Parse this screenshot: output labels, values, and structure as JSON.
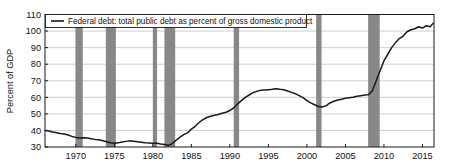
{
  "chart_data": {
    "type": "line",
    "title": "",
    "subtitle": "",
    "xlabel": "",
    "ylabel": "Percent of GDP",
    "legend": [
      {
        "name": "Federal debt: total public debt as percent of gross domestic product",
        "color": "#1a1a1a",
        "position": "top-left-inside"
      }
    ],
    "xlim": [
      1966.0,
      2016.5
    ],
    "ylim": [
      30,
      110
    ],
    "xticks": [
      1970,
      1975,
      1980,
      1985,
      1990,
      1995,
      2000,
      2005,
      2010,
      2015
    ],
    "xtick_labels": [
      "1970",
      "1975",
      "1980",
      "1985",
      "1990",
      "1995",
      "2000",
      "2005",
      "2010",
      "2015"
    ],
    "yticks": [
      30,
      40,
      50,
      60,
      70,
      80,
      90,
      100,
      110
    ],
    "ytick_labels": [
      "30",
      "40",
      "50",
      "60",
      "70",
      "80",
      "90",
      "100",
      "110"
    ],
    "grid": {
      "horizontal": true,
      "vertical": false,
      "color": "#c9c9c9"
    },
    "shaded_bands": {
      "name": "recession-bands",
      "color": "#888888",
      "orientation": "vertical",
      "intervals": [
        [
          1969.95,
          1970.9
        ],
        [
          1973.9,
          1975.2
        ],
        [
          1980.0,
          1980.55
        ],
        [
          1981.5,
          1982.9
        ],
        [
          1990.5,
          1991.2
        ],
        [
          2001.2,
          2001.9
        ],
        [
          2007.95,
          2009.45
        ]
      ]
    },
    "series": [
      {
        "name": "Federal debt: total public debt as percent of gross domestic product",
        "color": "#1a1a1a",
        "x": [
          1966.0,
          1966.5,
          1967.0,
          1967.5,
          1968.0,
          1968.5,
          1969.0,
          1969.5,
          1970.0,
          1970.5,
          1971.0,
          1971.5,
          1972.0,
          1972.5,
          1973.0,
          1973.5,
          1974.0,
          1974.5,
          1975.0,
          1975.5,
          1976.0,
          1976.5,
          1977.0,
          1977.5,
          1978.0,
          1978.5,
          1979.0,
          1979.5,
          1980.0,
          1980.5,
          1981.0,
          1981.5,
          1982.0,
          1982.5,
          1983.0,
          1983.5,
          1984.0,
          1984.5,
          1985.0,
          1985.5,
          1986.0,
          1986.5,
          1987.0,
          1987.5,
          1988.0,
          1988.5,
          1989.0,
          1989.5,
          1990.0,
          1990.5,
          1991.0,
          1991.5,
          1992.0,
          1992.5,
          1993.0,
          1993.5,
          1994.0,
          1994.5,
          1995.0,
          1995.5,
          1996.0,
          1996.5,
          1997.0,
          1997.5,
          1998.0,
          1998.5,
          1999.0,
          1999.5,
          2000.0,
          2000.5,
          2001.0,
          2001.5,
          2002.0,
          2002.5,
          2003.0,
          2003.5,
          2004.0,
          2004.5,
          2005.0,
          2005.5,
          2006.0,
          2006.5,
          2007.0,
          2007.5,
          2008.0,
          2008.5,
          2009.0,
          2009.5,
          2010.0,
          2010.5,
          2011.0,
          2011.5,
          2012.0,
          2012.5,
          2013.0,
          2013.5,
          2014.0,
          2014.5,
          2015.0,
          2015.5,
          2016.0,
          2016.4
        ],
        "y": [
          40.0,
          39.6,
          39.0,
          38.6,
          38.2,
          37.9,
          37.2,
          36.4,
          35.8,
          35.5,
          35.6,
          35.4,
          35.0,
          34.6,
          34.4,
          33.8,
          33.2,
          32.6,
          32.2,
          32.5,
          33.0,
          33.4,
          33.7,
          33.5,
          33.2,
          32.9,
          32.6,
          32.4,
          32.2,
          32.3,
          31.8,
          31.5,
          31.0,
          32.0,
          34.0,
          35.8,
          37.5,
          38.5,
          40.8,
          42.5,
          44.8,
          46.5,
          47.8,
          48.6,
          49.2,
          49.6,
          50.4,
          51.0,
          52.0,
          53.6,
          56.0,
          58.0,
          60.0,
          61.4,
          62.8,
          63.6,
          64.2,
          64.4,
          64.6,
          64.8,
          65.2,
          64.8,
          64.6,
          63.8,
          63.0,
          62.2,
          61.0,
          59.8,
          58.0,
          56.6,
          55.5,
          54.4,
          54.2,
          55.0,
          56.6,
          57.6,
          58.4,
          58.8,
          59.4,
          59.8,
          60.0,
          60.6,
          61.0,
          61.4,
          61.5,
          64.0,
          70.0,
          76.0,
          82.0,
          86.0,
          90.0,
          93.0,
          95.5,
          97.0,
          99.6,
          100.8,
          101.4,
          102.6,
          101.8,
          103.2,
          102.6,
          104.8
        ]
      }
    ]
  },
  "axes": {
    "ylabel": "Percent of GDP",
    "ytick_labels": [
      "110",
      "100",
      "90",
      "80",
      "70",
      "60",
      "50",
      "40",
      "30"
    ],
    "xtick_labels": [
      "1970",
      "1975",
      "1980",
      "1985",
      "1990",
      "1995",
      "2000",
      "2005",
      "2010",
      "2015"
    ]
  },
  "legend": {
    "entry_label": "Federal debt: total public debt as percent of gross domestic product"
  }
}
